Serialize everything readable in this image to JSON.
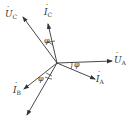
{
  "diagram": {
    "type": "phasor-diagram",
    "origin": [
      57,
      63
    ],
    "color": "#333333",
    "phasors": [
      {
        "id": "UA",
        "symbol": "U",
        "subscript": "A",
        "dotted": true,
        "tip": [
          112,
          61
        ],
        "label_pos": [
          114,
          56
        ]
      },
      {
        "id": "IA",
        "symbol": "I",
        "subscript": "A",
        "dotted": true,
        "tip": [
          95,
          79
        ],
        "label_pos": [
          96,
          75
        ]
      },
      {
        "id": "UC",
        "symbol": "U",
        "subscript": "C",
        "dotted": true,
        "tip": [
          23,
          17
        ],
        "label_pos": [
          5,
          10
        ]
      },
      {
        "id": "IC",
        "symbol": "I",
        "subscript": "C",
        "dotted": true,
        "tip": [
          48,
          24
        ],
        "label_pos": [
          44,
          8
        ]
      },
      {
        "id": "IB",
        "symbol": "I",
        "subscript": "B",
        "dotted": true,
        "tip": [
          24,
          89
        ],
        "label_pos": [
          13,
          86
        ]
      },
      {
        "id": "UB",
        "symbol": "U",
        "subscript": "B",
        "dotted": true,
        "tip": [
          27,
          115
        ],
        "label_pos": null
      }
    ],
    "angles": [
      {
        "label": "φ",
        "pos": [
          44,
          37
        ]
      },
      {
        "label": "φ",
        "pos": [
          74,
          61
        ]
      },
      {
        "label": "φ",
        "pos": [
          38,
          75
        ]
      }
    ]
  }
}
